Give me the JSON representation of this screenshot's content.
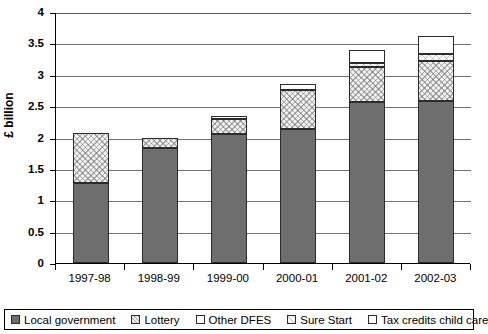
{
  "chart_data": {
    "type": "bar",
    "stacked": true,
    "title": "",
    "xlabel": "",
    "ylabel": "£ billion",
    "ylim": [
      0,
      4
    ],
    "ytick_step": 0.5,
    "yticks": [
      "0",
      "0.5",
      "1",
      "1.5",
      "2",
      "2.5",
      "3",
      "3.5",
      "4"
    ],
    "grid": true,
    "grid_axis": "y",
    "legend_position": "bottom",
    "categories": [
      "1997-98",
      "1998-99",
      "1999-00",
      "2000-01",
      "2001-02",
      "2002-03"
    ],
    "series": [
      {
        "name": "Local government",
        "values": [
          1.27,
          1.84,
          2.05,
          2.13,
          2.56,
          2.58
        ]
      },
      {
        "name": "Lottery",
        "values": [
          0.81,
          0.15,
          0.25,
          0.63,
          0.56,
          0.64
        ]
      },
      {
        "name": "Other DFES",
        "values": [
          0.0,
          0.0,
          0.04,
          0.09,
          0.0,
          0.0
        ]
      },
      {
        "name": "Sure Start",
        "values": [
          0.0,
          0.0,
          0.0,
          0.0,
          0.07,
          0.11
        ]
      },
      {
        "name": "Tax credits child care",
        "values": [
          0.0,
          0.0,
          0.0,
          0.0,
          0.21,
          0.28
        ]
      }
    ],
    "totals": [
      2.08,
      1.99,
      2.34,
      2.85,
      3.4,
      3.61
    ],
    "colors": {
      "Local government": "#6e6e6e",
      "Lottery": "#efefef",
      "Other DFES": "#ffffff",
      "Sure Start": "#fafafa",
      "Tax credits child care": "#ffffff"
    }
  },
  "legend": {
    "items": [
      {
        "label": "Local government"
      },
      {
        "label": "Lottery"
      },
      {
        "label": "Other DFES"
      },
      {
        "label": "Sure Start"
      },
      {
        "label": "Tax credits child care"
      }
    ]
  }
}
